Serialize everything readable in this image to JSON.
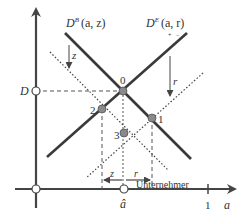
{
  "diagram": {
    "curves": {
      "db": {
        "label": "D",
        "superscript": "B",
        "args": "(a, z)",
        "signs": [
          "",
          ""
        ]
      },
      "de": {
        "label": "D",
        "superscript": "E",
        "args": "(a, r)",
        "signs": [
          "+",
          "−"
        ]
      }
    },
    "shifts": {
      "z_label": "z",
      "r_label": "r"
    },
    "points": [
      {
        "id": "0",
        "label": "0"
      },
      {
        "id": "1",
        "label": "1"
      },
      {
        "id": "2",
        "label": "2"
      },
      {
        "id": "3",
        "label": "3"
      }
    ],
    "axes": {
      "y_marker": "D",
      "x_label": "a",
      "x_tick_one": "1",
      "x_hat": "â",
      "region_label": "Unternehmer"
    },
    "bottom_arrows": {
      "left": "z",
      "right": "r"
    },
    "colors": {
      "curve": "#3a3a3a",
      "axis": "#444444",
      "point_fill": "#8a8a8a",
      "dashed": "#555555"
    }
  }
}
